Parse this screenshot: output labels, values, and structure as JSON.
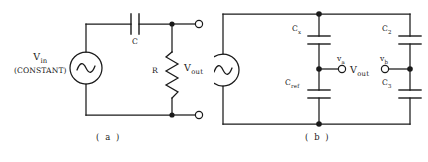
{
  "figure": {
    "panels": [
      {
        "id": "a",
        "caption": "( a )",
        "source": {
          "name": "ac-source",
          "label_main": "V",
          "label_sub": "in",
          "label_note": "(CONSTANT)"
        },
        "components": [
          {
            "name": "capacitor-c",
            "label": "C",
            "type": "capacitor"
          },
          {
            "name": "resistor-r",
            "label": "R",
            "type": "resistor"
          }
        ],
        "output": {
          "label_main": "V",
          "label_sub": "out"
        }
      },
      {
        "id": "b",
        "caption": "( b )",
        "source": {
          "name": "ac-source",
          "label_main": "",
          "label_sub": "",
          "label_note": ""
        },
        "components": [
          {
            "name": "capacitor-cx",
            "label_main": "C",
            "label_sub": "x",
            "type": "capacitor"
          },
          {
            "name": "capacitor-cref",
            "label_main": "C",
            "label_sub": "ref",
            "type": "capacitor"
          },
          {
            "name": "capacitor-c2",
            "label_main": "C",
            "label_sub": "2",
            "type": "capacitor"
          },
          {
            "name": "capacitor-c3",
            "label_main": "C",
            "label_sub": "3",
            "type": "capacitor"
          }
        ],
        "nodes": [
          {
            "name": "node-va",
            "label_main": "v",
            "label_sub": "a"
          },
          {
            "name": "node-vb",
            "label_main": "v",
            "label_sub": "b"
          }
        ],
        "output": {
          "label_main": "V",
          "label_sub": "out"
        }
      }
    ],
    "style": {
      "line_color": "#1a1a1a",
      "background": "#ffffff",
      "text_color": "#1a1a1a"
    }
  }
}
